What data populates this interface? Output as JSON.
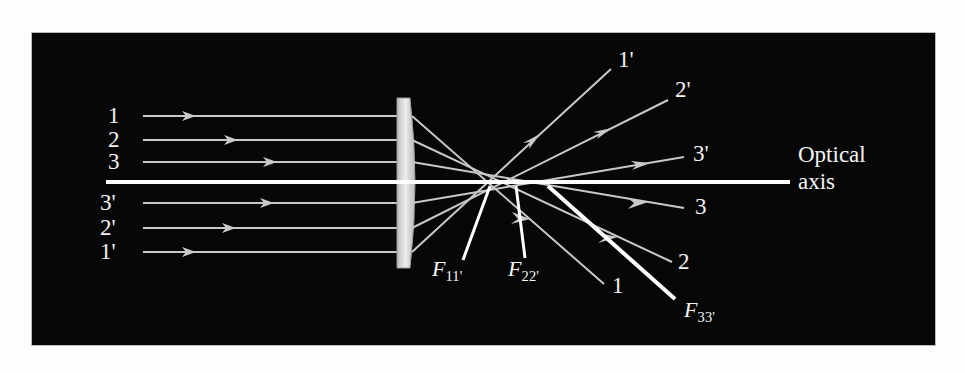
{
  "figure": {
    "kind": "optics-ray-diagram",
    "background_color": "#fdfdfd",
    "panel_color": "#070707",
    "ray_color": "#cfcfcf",
    "bright_color": "#ffffff",
    "lens_color": "#d8d8d8",
    "text_color": "#f2f2f2"
  },
  "optical_axis": {
    "label_line1": "Optical",
    "label_line2": "axis"
  },
  "lens": {
    "name": "converging-lens"
  },
  "incoming_rays": [
    {
      "label": "1",
      "y": 116
    },
    {
      "label": "2",
      "y": 140
    },
    {
      "label": "3",
      "y": 162
    },
    {
      "label": "3'",
      "y": 203
    },
    {
      "label": "2'",
      "y": 228
    },
    {
      "label": "1'",
      "y": 252
    }
  ],
  "outgoing_rays": [
    {
      "label": "1'",
      "position": "upper"
    },
    {
      "label": "2'",
      "position": "upper"
    },
    {
      "label": "3'",
      "position": "upper"
    },
    {
      "label": "3",
      "position": "lower"
    },
    {
      "label": "2",
      "position": "lower"
    },
    {
      "label": "1",
      "position": "lower"
    }
  ],
  "focal_points": [
    {
      "name": "F",
      "subscript": "11'"
    },
    {
      "name": "F",
      "subscript": "22'"
    },
    {
      "name": "F",
      "subscript": "33'"
    }
  ]
}
